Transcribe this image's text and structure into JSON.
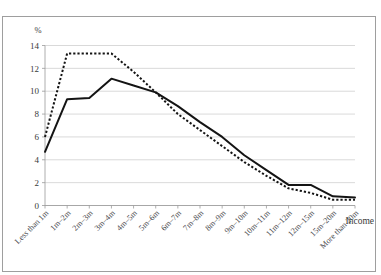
{
  "figure": {
    "top_caption": "",
    "frame_visible": true
  },
  "chart_data": {
    "type": "line",
    "title": "",
    "subtitle": "",
    "xlabel": "Income",
    "ylabel": "%",
    "ylim": [
      0,
      14
    ],
    "yticks": [
      0,
      2,
      4,
      6,
      8,
      10,
      12,
      14
    ],
    "ytick_labels": [
      "0",
      "2",
      "4",
      "6",
      "8",
      "10",
      "12",
      "14"
    ],
    "grid": true,
    "grid_axis": "y",
    "legend": false,
    "legend_position": "none",
    "categories": [
      "Less than 1m",
      "1m–2m",
      "2m–3m",
      "3m–4m",
      "4m–5m",
      "5m–6m",
      "6m–7m",
      "7m–8m",
      "8m–9m",
      "9m–10m",
      "10m–11m",
      "11m–12m",
      "12m–15m",
      "15m–20m",
      "More than 20m"
    ],
    "series": [
      {
        "name": "series-solid",
        "style": "solid",
        "color": "#141414",
        "values": [
          4.7,
          9.3,
          9.4,
          11.1,
          10.5,
          9.9,
          8.7,
          7.3,
          6.0,
          4.4,
          3.1,
          1.8,
          1.8,
          0.8,
          0.7
        ]
      },
      {
        "name": "series-dotted",
        "style": "dotted",
        "color": "#141414",
        "values": [
          6.0,
          13.3,
          13.3,
          13.3,
          11.7,
          9.9,
          8.0,
          6.6,
          5.2,
          3.8,
          2.6,
          1.5,
          1.1,
          0.5,
          0.5
        ]
      }
    ]
  },
  "axis": {
    "y_unit_label": "%",
    "x_title": "Income"
  }
}
